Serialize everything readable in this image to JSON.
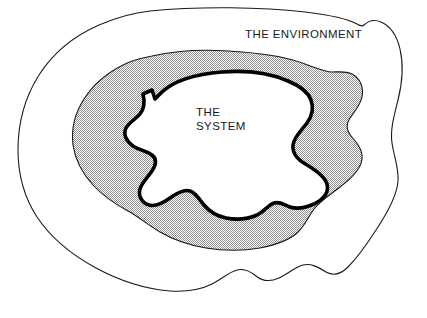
{
  "diagram": {
    "type": "venn-nested-blob",
    "background_color": "#ffffff",
    "labels": {
      "environment": "THE ENVIRONMENT",
      "system_line1": "THE",
      "system_line2": "SYSTEM"
    },
    "regions": [
      {
        "name": "environment",
        "label": "THE ENVIRONMENT",
        "fill": "#ffffff",
        "stroke": "#1a1a1a",
        "stroke_width": 1.1,
        "description": "Outer irregular closed freehand blob spanning nearly the full canvas"
      },
      {
        "name": "boundary-band",
        "label": "",
        "fill": "#c9c9c9",
        "stroke": "#1a1a1a",
        "stroke_width": 1.1,
        "description": "Shaded dithered intermediate band between the environment outline and the system outline"
      },
      {
        "name": "system",
        "label": "THE SYSTEM",
        "fill": "#ffffff",
        "stroke": "#000000",
        "stroke_width": 3.6,
        "description": "Inner jagged closed blob drawn with a heavy black stroke"
      }
    ],
    "colors": {
      "ink": "#1a1a1a",
      "heavy_ink": "#000000",
      "shade": "#c9c9c9",
      "paper": "#ffffff"
    }
  }
}
